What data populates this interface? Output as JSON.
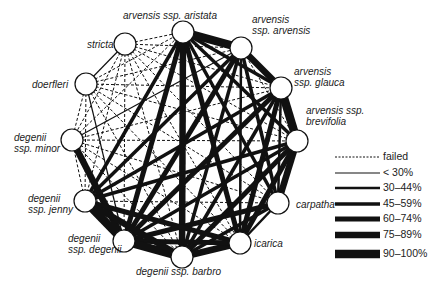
{
  "diagram": {
    "type": "crossing-compatibility network",
    "nodes": [
      {
        "id": "aristata",
        "line1": "arvensis",
        "line1b": " ssp. aristata",
        "x": 183,
        "y": 32
      },
      {
        "id": "arvensis",
        "line1": "arvensis",
        "line2": "ssp. arvensis",
        "x": 241,
        "y": 48
      },
      {
        "id": "glauca",
        "line1": "arvensis",
        "line2": "ssp. glauca",
        "x": 281,
        "y": 88
      },
      {
        "id": "brevifolia",
        "line1": "arvensis ssp.",
        "line2": "brevifolia",
        "x": 297,
        "y": 141
      },
      {
        "id": "carpatha",
        "line1": "carpatha",
        "x": 278,
        "y": 203
      },
      {
        "id": "icarica",
        "line1": "icarica",
        "x": 240,
        "y": 243
      },
      {
        "id": "barbro",
        "line1": "degenii",
        "line1b": " ssp. barbro",
        "x": 182,
        "y": 257
      },
      {
        "id": "degenii",
        "line1": "degenii",
        "line2": "ssp. degenii",
        "x": 124,
        "y": 241
      },
      {
        "id": "jenny",
        "line1": "degenii",
        "line2": "ssp. jenny",
        "x": 85,
        "y": 201
      },
      {
        "id": "minor",
        "line1": "degenii",
        "line2": "ssp. minor",
        "x": 72,
        "y": 140
      },
      {
        "id": "doerfleri",
        "line1": "doerfleri",
        "x": 86,
        "y": 84
      },
      {
        "id": "stricta",
        "line1": "stricta",
        "x": 125,
        "y": 44
      }
    ],
    "legend": [
      {
        "label": "failed",
        "style": "dashed",
        "width": 1
      },
      {
        "label": "< 30%",
        "style": "solid",
        "width": 1.2
      },
      {
        "label": "30–44%",
        "style": "solid",
        "width": 2.5
      },
      {
        "label": "45–59%",
        "style": "solid",
        "width": 3.5
      },
      {
        "label": "60–74%",
        "style": "solid",
        "width": 5
      },
      {
        "label": "75–89%",
        "style": "solid",
        "width": 6.5
      },
      {
        "label": "90–100%",
        "style": "solid",
        "width": 8.5
      }
    ]
  }
}
